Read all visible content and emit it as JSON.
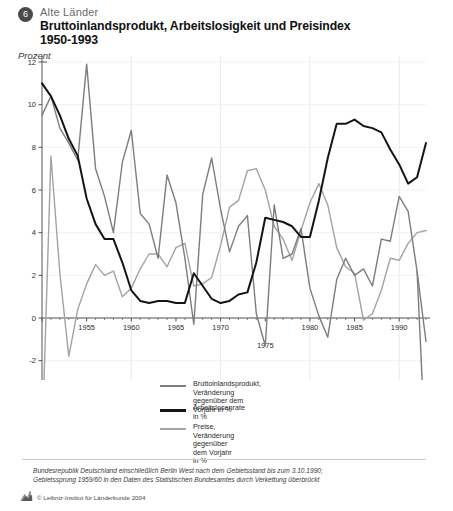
{
  "header": {
    "number": "6",
    "region": "Alte Länder",
    "title_line1": "Bruttoinlandsprodukt, Arbeitslosigkeit und Preisindex",
    "title_line2": "1950-1993",
    "unit": "Prozent"
  },
  "legend": [
    {
      "label": "Bruttoinlandsprodukt, Veränderung\ngegenüber dem Vorjahr in %",
      "color": "#7d7d7d",
      "weight": "normal",
      "key": "gdp"
    },
    {
      "label": "Arbeitslosenrate in %",
      "color": "#141414",
      "weight": "thick",
      "key": "unemployment"
    },
    {
      "label": "Preise, Veränderung gegenüber\ndem Vorjahr in %",
      "color": "#a3a3a3",
      "weight": "normal",
      "key": "prices"
    }
  ],
  "footer": {
    "note": "Bundesrepublik Deutschland einschließlich Berlin West nach dem Gebietsstand bis zum 3.10.1990;\nGebietssprung 1959/60 in den Daten des Statistischen Bundesamtes durch Verkettung überbrückt",
    "copyright": "© Leibniz-Institut für Länderkunde 2004",
    "logo_alt": "leibniz-logo-icon"
  },
  "chart_data": {
    "type": "line",
    "title": "Bruttoinlandsprodukt, Arbeitslosigkeit und Preisindex 1950-1993",
    "xlabel": "",
    "ylabel": "Prozent",
    "xlim": [
      1950,
      1993
    ],
    "ylim": [
      -6,
      12
    ],
    "yticks": [
      -6,
      -4,
      -2,
      0,
      2,
      4,
      6,
      8,
      10,
      12
    ],
    "xticks": [
      1950,
      1955,
      1960,
      1965,
      1970,
      1975,
      1980,
      1985,
      1990
    ],
    "xtick_labels": [
      "1950",
      "1955",
      "1960",
      "1965",
      "1970",
      "1975",
      "1980",
      "1985",
      "1990"
    ],
    "grid": "horizontal-and-vertical-faint",
    "legend_position": "below-plot",
    "x": [
      1950,
      1951,
      1952,
      1953,
      1954,
      1955,
      1956,
      1957,
      1958,
      1959,
      1960,
      1961,
      1962,
      1963,
      1964,
      1965,
      1966,
      1967,
      1968,
      1969,
      1970,
      1971,
      1972,
      1973,
      1974,
      1975,
      1976,
      1977,
      1978,
      1979,
      1980,
      1981,
      1982,
      1983,
      1984,
      1985,
      1986,
      1987,
      1988,
      1989,
      1990,
      1991,
      1992,
      1993
    ],
    "series": [
      {
        "name": "Bruttoinlandsprodukt, Veränderung gegenüber dem Vorjahr in %",
        "key": "gdp",
        "color": "#7d7d7d",
        "width": 1.4,
        "values": [
          9.5,
          10.4,
          8.9,
          8.2,
          7.4,
          11.9,
          7.0,
          5.7,
          4.0,
          7.3,
          8.8,
          4.9,
          4.4,
          2.8,
          6.7,
          5.4,
          2.8,
          -0.3,
          5.8,
          7.5,
          5.1,
          3.1,
          4.3,
          4.8,
          0.2,
          -1.3,
          5.3,
          2.8,
          3.0,
          4.2,
          1.4,
          0.1,
          -0.9,
          1.8,
          2.8,
          2.0,
          2.3,
          1.5,
          3.7,
          3.6,
          5.7,
          5.0,
          2.2,
          -1.1
        ]
      },
      {
        "name": "Arbeitslosenrate in %",
        "key": "unemployment",
        "color": "#141414",
        "width": 2.0,
        "values": [
          11.0,
          10.4,
          9.5,
          8.4,
          7.6,
          5.6,
          4.4,
          3.7,
          3.7,
          2.6,
          1.3,
          0.8,
          0.7,
          0.8,
          0.8,
          0.7,
          0.7,
          2.1,
          1.5,
          0.9,
          0.7,
          0.8,
          1.1,
          1.2,
          2.6,
          4.7,
          4.6,
          4.5,
          4.3,
          3.8,
          3.8,
          5.5,
          7.5,
          9.1,
          9.1,
          9.3,
          9.0,
          8.9,
          8.7,
          7.9,
          7.2,
          6.3,
          6.6,
          8.2
        ]
      },
      {
        "name": "Preise, Veränderung gegenüber dem Vorjahr in %",
        "key": "prices",
        "color": "#a3a3a3",
        "width": 1.4,
        "values": [
          -6.0,
          7.6,
          2.1,
          -1.8,
          0.4,
          1.6,
          2.5,
          2.0,
          2.2,
          1.0,
          1.4,
          2.3,
          3.0,
          3.0,
          2.4,
          3.3,
          3.5,
          1.5,
          1.6,
          1.9,
          3.4,
          5.2,
          5.5,
          6.9,
          7.0,
          6.0,
          4.3,
          3.7,
          2.7,
          4.1,
          5.4,
          6.3,
          5.3,
          3.3,
          2.4,
          2.1,
          -0.1,
          0.2,
          1.3,
          2.8,
          2.7,
          3.5,
          4.0,
          4.1
        ]
      }
    ]
  }
}
